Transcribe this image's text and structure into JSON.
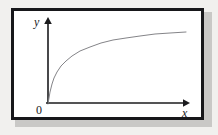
{
  "figure": {
    "background_color": "#f1f0ee",
    "frame_color": "#17171a",
    "frame_fill": "#ffffff",
    "shadow_color": "#c9c8c6",
    "axis_color": "#1b1b1d",
    "curve_color": "#848488",
    "clipped_caption_text": "",
    "labels": {
      "y_axis": "y",
      "x_axis": "x",
      "origin": "0"
    }
  },
  "chart_data": {
    "type": "line",
    "title": "",
    "subtitle": "",
    "xlabel": "x",
    "ylabel": "y",
    "origin_label": "0",
    "grid": false,
    "legend": null,
    "axes": {
      "x": {
        "from_px": 46,
        "to_px": 189,
        "y_px": 103,
        "arrow": "right",
        "ticks": [],
        "ticklabels": []
      },
      "y": {
        "from_px": 104,
        "to_px": 18,
        "x_px": 48,
        "arrow": "up",
        "ticks": [],
        "ticklabels": []
      }
    },
    "xlim": [
      0,
      1
    ],
    "ylim": [
      0,
      1
    ],
    "series": [
      {
        "name": "curve",
        "color": "#848488",
        "width_px": 1,
        "points_px": [
          [
            48,
            104
          ],
          [
            50,
            92
          ],
          [
            52,
            84
          ],
          [
            54,
            78
          ],
          [
            57,
            72
          ],
          [
            61,
            66
          ],
          [
            66,
            61
          ],
          [
            72,
            56
          ],
          [
            80,
            51
          ],
          [
            90,
            47
          ],
          [
            101,
            43
          ],
          [
            113,
            40
          ],
          [
            126,
            38
          ],
          [
            140,
            36
          ],
          [
            155,
            34
          ],
          [
            170,
            33
          ],
          [
            186,
            32
          ]
        ],
        "x": [
          0.0,
          0.01,
          0.03,
          0.04,
          0.06,
          0.09,
          0.13,
          0.17,
          0.23,
          0.3,
          0.38,
          0.46,
          0.55,
          0.66,
          0.76,
          0.85,
          0.97
        ],
        "y": [
          0.0,
          0.14,
          0.23,
          0.3,
          0.37,
          0.44,
          0.5,
          0.56,
          0.62,
          0.66,
          0.71,
          0.74,
          0.77,
          0.79,
          0.81,
          0.83,
          0.84
        ]
      }
    ]
  }
}
